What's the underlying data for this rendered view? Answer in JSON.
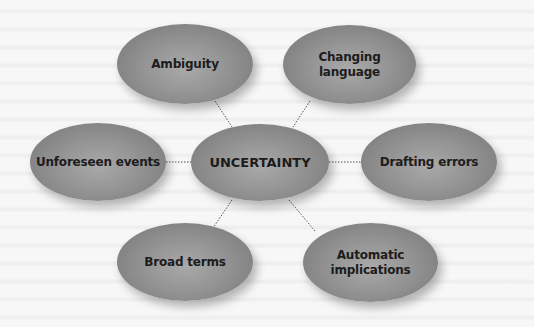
{
  "diagram": {
    "type": "mind-map",
    "center": {
      "label": "UNCERTAINTY"
    },
    "nodes": [
      {
        "id": "ambiguity",
        "label": "Ambiguity",
        "position": "top-left"
      },
      {
        "id": "changing-language",
        "label": "Changing\nlanguage",
        "position": "top-right"
      },
      {
        "id": "unforeseen-events",
        "label": "Unforeseen events",
        "position": "left"
      },
      {
        "id": "drafting-errors",
        "label": "Drafting errors",
        "position": "right"
      },
      {
        "id": "broad-terms",
        "label": "Broad terms",
        "position": "bottom-left"
      },
      {
        "id": "automatic-implications",
        "label": "Automatic\nimplications",
        "position": "bottom-right"
      }
    ],
    "connector_style": "dotted",
    "colors": {
      "node_fill": "#8e8e8e",
      "node_highlight": "#a9a9a9",
      "text": "#1c1c1c",
      "connector": "#555555",
      "background": "#f7f7f7"
    }
  }
}
